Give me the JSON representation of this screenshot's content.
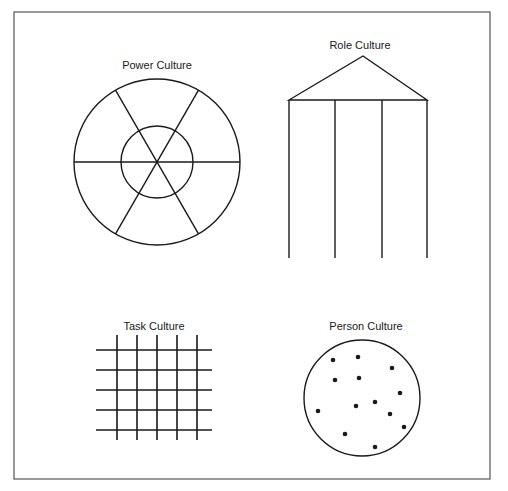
{
  "figure": {
    "border": {
      "x": 14,
      "y": 12,
      "width": 476,
      "height": 467,
      "color": "#555555"
    },
    "stroke_color": "#1a1a1a"
  },
  "power_culture": {
    "title": "Power Culture",
    "shape": "web",
    "center": [
      157,
      162
    ],
    "outer_radius": 83,
    "inner_radius": 36,
    "spokes": 6
  },
  "role_culture": {
    "title": "Role Culture",
    "shape": "temple",
    "apex": [
      363,
      56
    ],
    "roof_y": 100,
    "pillars_x": [
      289,
      335,
      382,
      427
    ],
    "pillar_bottom_y": 258
  },
  "task_culture": {
    "title": "Task Culture",
    "shape": "net",
    "vertical_lines_x": [
      117,
      137,
      157,
      177,
      197
    ],
    "vertical_span": [
      335,
      440
    ],
    "horizontal_lines_y": [
      350,
      370,
      390,
      410,
      430
    ],
    "horizontal_span": [
      96,
      212
    ]
  },
  "person_culture": {
    "title": "Person Culture",
    "shape": "cluster",
    "center": [
      362,
      398
    ],
    "radius": 58,
    "dots": [
      [
        333,
        360
      ],
      [
        358,
        357
      ],
      [
        392,
        368
      ],
      [
        335,
        380
      ],
      [
        359,
        378
      ],
      [
        400,
        393
      ],
      [
        318,
        411
      ],
      [
        356,
        406
      ],
      [
        375,
        402
      ],
      [
        390,
        414
      ],
      [
        404,
        427
      ],
      [
        345,
        434
      ],
      [
        375,
        447
      ]
    ]
  }
}
